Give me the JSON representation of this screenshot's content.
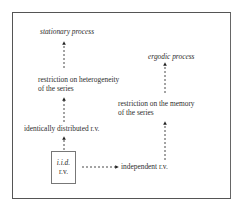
{
  "diagram": {
    "nodes": {
      "stationary": "stationary process",
      "heterogeneity_line1": "restriction on heterogeneity",
      "heterogeneity_line2": "of the series",
      "identically": "identically distributed r.v.",
      "iid_line1": "i.i.d.",
      "iid_line2": "r.v.",
      "ergodic": "ergodic process",
      "memory_line1": "restriction on the memory",
      "memory_line2": "of the series",
      "independent": "independent r.v."
    },
    "edges": [
      {
        "from": "iid",
        "to": "identically distributed r.v.",
        "style": "dashed"
      },
      {
        "from": "identically distributed r.v.",
        "to": "restriction on heterogeneity of the series",
        "style": "dashed"
      },
      {
        "from": "restriction on heterogeneity of the series",
        "to": "stationary process",
        "style": "dashed"
      },
      {
        "from": "iid",
        "to": "independent r.v.",
        "style": "dashed"
      },
      {
        "from": "independent r.v.",
        "to": "restriction on the memory of the series",
        "style": "dashed"
      },
      {
        "from": "restriction on the memory of the series",
        "to": "ergodic process",
        "style": "dashed"
      }
    ]
  }
}
